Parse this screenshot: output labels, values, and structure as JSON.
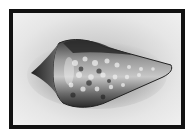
{
  "image": {
    "subject": "cone shell",
    "description": "Grayscale photograph of a spotted cone-shaped seashell on a light gray background inside a thick black frame",
    "colors": {
      "frame": "#111111",
      "background": "#e6e6e6",
      "shell_dark": "#2a2a2a",
      "shell_light": "#d9d9d9"
    }
  }
}
